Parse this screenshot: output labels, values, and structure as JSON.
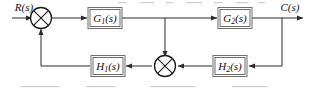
{
  "figure": {
    "kind": "control-system-block-diagram",
    "background_color": "#ffffff",
    "line_color": "#2b2b2b",
    "block_border_color": "#6f6f6f",
    "text_color": "#111111"
  },
  "signals": {
    "input": {
      "base": "R",
      "arg": "(s)",
      "full": "R(s)"
    },
    "output": {
      "base": "C",
      "arg": "(s)",
      "full": "C(s)"
    }
  },
  "blocks": [
    {
      "id": "g1",
      "base": "G",
      "sub": "1",
      "arg": "(s)",
      "full": "G1(s)"
    },
    {
      "id": "g2",
      "base": "G",
      "sub": "2",
      "arg": "(s)",
      "full": "G2(s)"
    },
    {
      "id": "h1",
      "base": "H",
      "sub": "1",
      "arg": "(s)",
      "full": "H1(s)"
    },
    {
      "id": "h2",
      "base": "H",
      "sub": "2",
      "arg": "(s)",
      "full": "H2(s)"
    }
  ],
  "summing_junctions": [
    {
      "id": "sum1",
      "symbol": "crossed-circle"
    },
    {
      "id": "sum2",
      "symbol": "crossed-circle"
    }
  ]
}
